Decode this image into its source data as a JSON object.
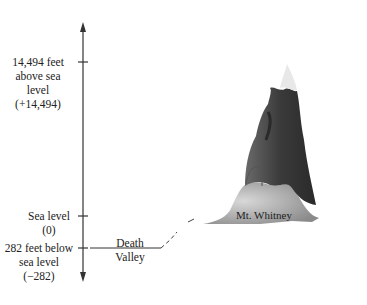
{
  "diagram": {
    "axis": {
      "labels": [
        {
          "lines": [
            "14,494 feet",
            "above sea",
            "level",
            "(+14,494)"
          ],
          "value": 14494
        },
        {
          "lines": [
            "Sea level",
            "(0)"
          ],
          "value": 0
        },
        {
          "lines": [
            "282 feet below",
            "sea level",
            "(−282)"
          ],
          "value": -282
        }
      ]
    },
    "places": {
      "death_valley": {
        "lines": [
          "Death",
          "Valley"
        ]
      },
      "mountain": {
        "label": "Mt. Whitney",
        "icon": "mountain-icon"
      }
    }
  }
}
